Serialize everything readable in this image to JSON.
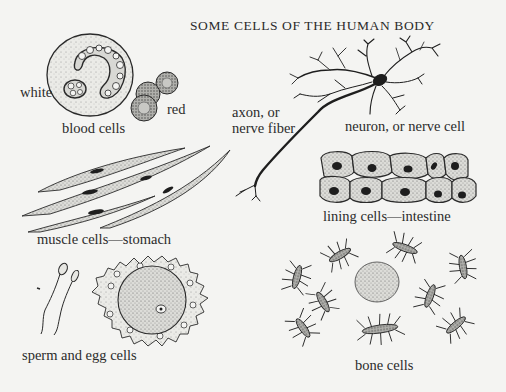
{
  "figure": {
    "title": "SOME CELLS OF THE HUMAN BODY",
    "background": "#f4f4f2",
    "ink_color": "#2a2a2a"
  },
  "cells": [
    {
      "id": "blood",
      "name": "blood cells",
      "labels": {
        "white": "white",
        "red": "red",
        "caption": "blood cells"
      }
    },
    {
      "id": "neuron",
      "name": "neuron, or nerve cell",
      "labels": {
        "axon_line1": "axon, or",
        "axon_line2": "nerve fiber",
        "caption": "neuron, or nerve cell"
      }
    },
    {
      "id": "lining",
      "name": "lining cells—intestine",
      "labels": {
        "caption": "lining cells—intestine"
      }
    },
    {
      "id": "muscle",
      "name": "muscle cells—stomach",
      "labels": {
        "caption": "muscle cells—stomach"
      }
    },
    {
      "id": "reproductive",
      "name": "sperm and egg cells",
      "labels": {
        "caption": "sperm and egg cells"
      }
    },
    {
      "id": "bone",
      "name": "bone cells",
      "labels": {
        "caption": "bone cells"
      }
    }
  ]
}
